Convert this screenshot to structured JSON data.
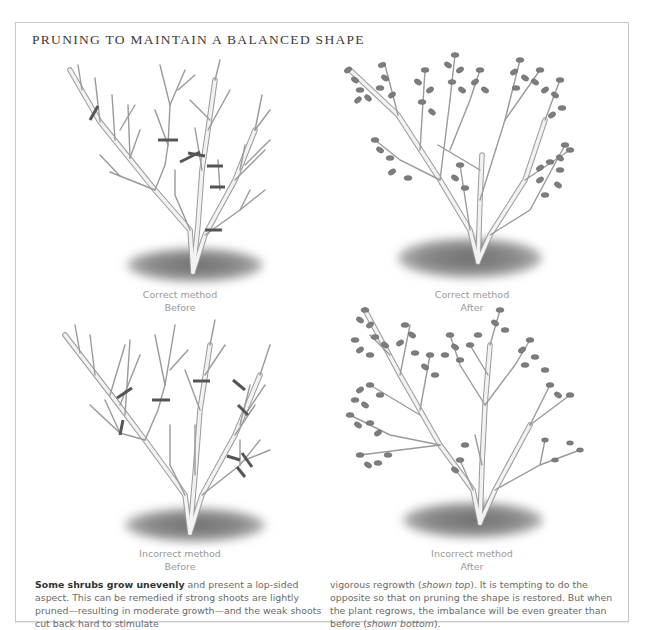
{
  "header": {
    "title": "PRUNING TO MAINTAIN A BALANCED SHAPE"
  },
  "figures": [
    {
      "id": "correct-before",
      "caption_line1": "Correct method",
      "caption_line2": "Before",
      "state": "bare branches with cut marks"
    },
    {
      "id": "correct-after",
      "caption_line1": "Correct method",
      "caption_line2": "After",
      "state": "balanced leafy regrowth"
    },
    {
      "id": "incorrect-before",
      "caption_line1": "Incorrect method",
      "caption_line2": "Before",
      "state": "bare branches with cut marks"
    },
    {
      "id": "incorrect-after",
      "caption_line1": "Incorrect method",
      "caption_line2": "After",
      "state": "imbalanced leafy regrowth"
    }
  ],
  "body": {
    "lead_bold": "Some shrubs grow unevenly",
    "col1_rest": " and present a lop-sided aspect. This can be remedied if strong shoots are lightly pruned—resulting in moderate growth—and the weak shoots cut back hard to stimulate",
    "col2_a": "vigorous regrowth (",
    "col2_italic1": "shown top",
    "col2_b": "). It is tempting to do the opposite so that on pruning the shape is restored. But when the plant regrows, the imbalance will be even greater than before (",
    "col2_italic2": "shown bottom",
    "col2_c": ")."
  },
  "colors": {
    "branch_fill": "#f2f2f2",
    "branch_outline": "#9a9a9a",
    "cut_mark": "#555555",
    "leaf": "#7d7d7d",
    "ground_shadow": "#8a8a8a",
    "caption": "#9a9a9a",
    "border": "#c9c9c9"
  }
}
